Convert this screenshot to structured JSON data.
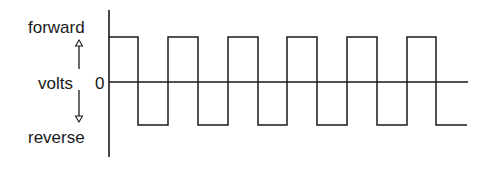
{
  "diagram": {
    "type": "square-wave-voltage",
    "labels": {
      "forward": "forward",
      "volts": "volts",
      "zero": "0",
      "reverse": "reverse"
    },
    "axis": {
      "vertical_label": "volts",
      "zero_level": "0",
      "positive_direction": "forward",
      "negative_direction": "reverse"
    },
    "waveform": {
      "shape": "square",
      "starts": "forward",
      "full_cycles": 5.5,
      "high_segments": 6,
      "low_segments": 6
    },
    "colors": {
      "line": "#1a1a1a",
      "background": "#ffffff"
    }
  }
}
